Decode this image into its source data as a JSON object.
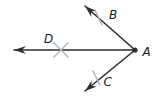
{
  "diagram": {
    "type": "geometry-angle-with-bisector-construction",
    "labels": {
      "vertex": "A",
      "upper_ray": "B",
      "lower_ray": "C",
      "bisector_point": "D"
    },
    "colors": {
      "line": "#2e2e2e",
      "tick": "#b0b0b0",
      "label": "#1c1c1c",
      "background": "#ffffff"
    }
  }
}
